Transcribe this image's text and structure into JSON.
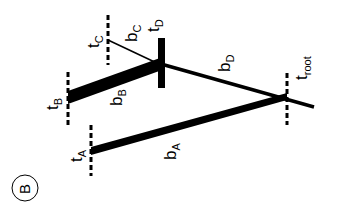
{
  "panel_label": "B",
  "nodes": {
    "A": {
      "time_label": "t",
      "time_sub": "A"
    },
    "B": {
      "time_label": "t",
      "time_sub": "B"
    },
    "C": {
      "time_label": "t",
      "time_sub": "C"
    },
    "D": {
      "time_label": "t",
      "time_sub": "D"
    },
    "root": {
      "time_label": "t",
      "time_sub": "root"
    }
  },
  "branches": {
    "A": {
      "label": "b",
      "sub": "A"
    },
    "B": {
      "label": "b",
      "sub": "B"
    },
    "C": {
      "label": "b",
      "sub": "C"
    },
    "D": {
      "label": "b",
      "sub": "D"
    }
  },
  "colors": {
    "ink": "#000000",
    "background": "#ffffff"
  }
}
